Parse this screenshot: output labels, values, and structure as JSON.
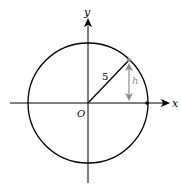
{
  "diagram": {
    "type": "circle-on-coordinate-axes",
    "axes": {
      "x_label": "x",
      "y_label": "y",
      "origin_label": "O"
    },
    "circle": {
      "radius_label": "5"
    },
    "height_marker": {
      "label": "h",
      "color": "#8c8c8c"
    },
    "colors": {
      "stroke": "#000000",
      "accent": "#8c8c8c",
      "background": "#ffffff"
    }
  }
}
